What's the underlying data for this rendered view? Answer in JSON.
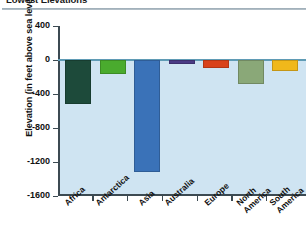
{
  "title": "Lowest Elevations",
  "axis": {
    "ylabel": "Elevation (in feet above sea level)",
    "yticks": [
      "400",
      "0",
      "-400",
      "-800",
      "-1200",
      "-1600"
    ]
  },
  "labels": {
    "africa": "Africa",
    "antarctica": "Antarctica",
    "asia": "Asia",
    "australia": "Australia",
    "europe": "Europe",
    "north_america": "North\nAmerica",
    "south_america": "South\nAmerica"
  },
  "chart_data": {
    "type": "bar",
    "title": "Lowest Elevations",
    "xlabel": "",
    "ylabel": "Elevation (in feet above sea level)",
    "ylim": [
      -1600,
      400
    ],
    "yticks": [
      400,
      0,
      -400,
      -800,
      -1200,
      -1600
    ],
    "grid": false,
    "legend": false,
    "categories": [
      "Africa",
      "Antarctica",
      "Asia",
      "Australia",
      "Europe",
      "North America",
      "South America"
    ],
    "values": [
      -512,
      -164,
      -1312,
      -52,
      -92,
      -282,
      -131
    ],
    "colors": [
      "#1d4a3a",
      "#4aab2e",
      "#3a72b8",
      "#4a3b85",
      "#d9421a",
      "#8aa878",
      "#f0b81b"
    ],
    "background": "#cfe4f2"
  }
}
